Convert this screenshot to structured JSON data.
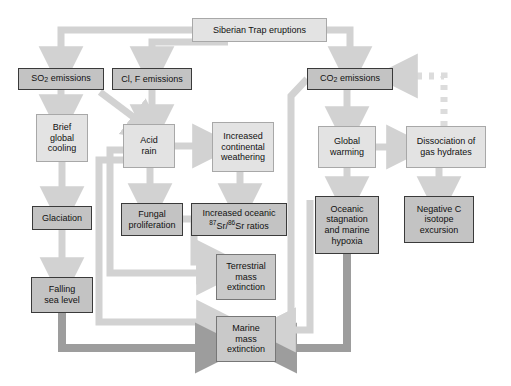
{
  "diagram": {
    "canvas": {
      "width": 511,
      "height": 386,
      "background": "#ffffff"
    },
    "colors": {
      "arrow_light": "#d2d2d2",
      "arrow_mid": "#bdbdbd",
      "arrow_dark": "#9d9d9d",
      "node_light_fill": "#e3e3e3",
      "node_light_border": "#a8a8a8",
      "node_mid_fill": "#c3c3c3",
      "node_mid_border": "#3a3a3a",
      "node_plain_fill": "#c9c9c9",
      "node_plain_border": "#777777",
      "text": "#111111"
    },
    "nodes": [
      {
        "id": "siberian",
        "label": "Siberian Trap eruptions",
        "style": "light",
        "x": 192,
        "y": 18,
        "w": 135,
        "h": 24
      },
      {
        "id": "so2",
        "label_html": "SO<span class=\"sub\">2</span> emissions",
        "label": "SO2 emissions",
        "style": "mid",
        "x": 18,
        "y": 68,
        "w": 86,
        "h": 22
      },
      {
        "id": "clf",
        "label": "Cl, F emissions",
        "style": "mid",
        "x": 112,
        "y": 68,
        "w": 80,
        "h": 22
      },
      {
        "id": "co2",
        "label_html": "CO<span class=\"sub\">2</span> emissions",
        "label": "CO2 emissions",
        "style": "mid",
        "x": 307,
        "y": 68,
        "w": 86,
        "h": 22
      },
      {
        "id": "brief",
        "label": "Brief\nglobal\ncooling",
        "style": "light",
        "x": 36,
        "y": 114,
        "w": 52,
        "h": 48
      },
      {
        "id": "acid",
        "label": "Acid\nrain",
        "style": "light",
        "x": 123,
        "y": 124,
        "w": 52,
        "h": 44
      },
      {
        "id": "weather",
        "label": "Increased\ncontinental\nweathering",
        "style": "light",
        "x": 212,
        "y": 122,
        "w": 62,
        "h": 50
      },
      {
        "id": "warming",
        "label": "Global\nwarming",
        "style": "light",
        "x": 318,
        "y": 126,
        "w": 58,
        "h": 42
      },
      {
        "id": "hydrates",
        "label": "Dissociation of\ngas hydrates",
        "style": "light",
        "x": 406,
        "y": 126,
        "w": 80,
        "h": 42
      },
      {
        "id": "glaciation",
        "label": "Glaciation",
        "style": "mid",
        "x": 32,
        "y": 206,
        "w": 60,
        "h": 24
      },
      {
        "id": "fungal",
        "label": "Fungal\nproliferation",
        "style": "mid",
        "x": 121,
        "y": 203,
        "w": 62,
        "h": 33
      },
      {
        "id": "srratio",
        "label_html": "Increased oceanic<br><span class=\"sup\">87</span>Sr/<span class=\"sup\">86</span>Sr ratios",
        "label": "Increased oceanic 87Sr/86Sr ratios",
        "style": "mid",
        "x": 191,
        "y": 203,
        "w": 96,
        "h": 33
      },
      {
        "id": "stagnation",
        "label": "Oceanic\nstagnation\nand marine\nhypoxia",
        "style": "mid",
        "x": 315,
        "y": 196,
        "w": 64,
        "h": 58
      },
      {
        "id": "negc",
        "label": "Negative C\nisotope\nexcursion",
        "style": "mid",
        "x": 404,
        "y": 196,
        "w": 70,
        "h": 47
      },
      {
        "id": "sealevel",
        "label": "Falling\nsea level",
        "style": "mid",
        "x": 31,
        "y": 277,
        "w": 62,
        "h": 36
      },
      {
        "id": "terrestrial",
        "label": "Terrestrial\nmass\nextinction",
        "style": "plain",
        "x": 216,
        "y": 254,
        "w": 60,
        "h": 46
      },
      {
        "id": "marine",
        "label": "Marine\nmass\nextinction",
        "style": "plain",
        "x": 216,
        "y": 316,
        "w": 60,
        "h": 46
      }
    ],
    "edges": [
      {
        "from": "siberian",
        "to": "so2",
        "kind": "solid",
        "tone": "light"
      },
      {
        "from": "siberian",
        "to": "clf",
        "kind": "solid",
        "tone": "light"
      },
      {
        "from": "siberian",
        "to": "co2",
        "kind": "solid",
        "tone": "light"
      },
      {
        "from": "so2",
        "to": "brief",
        "kind": "solid",
        "tone": "light"
      },
      {
        "from": "so2",
        "to": "acid",
        "kind": "solid",
        "tone": "light"
      },
      {
        "from": "clf",
        "to": "acid",
        "kind": "solid",
        "tone": "light"
      },
      {
        "from": "brief",
        "to": "glaciation",
        "kind": "solid",
        "tone": "light"
      },
      {
        "from": "glaciation",
        "to": "sealevel",
        "kind": "solid",
        "tone": "light"
      },
      {
        "from": "acid",
        "to": "fungal",
        "kind": "solid",
        "tone": "light"
      },
      {
        "from": "acid",
        "to": "weather",
        "kind": "solid",
        "tone": "light"
      },
      {
        "from": "co2",
        "to": "warming",
        "kind": "solid",
        "tone": "light"
      },
      {
        "from": "warming",
        "to": "hydrates",
        "kind": "solid",
        "tone": "light"
      },
      {
        "from": "warming",
        "to": "stagnation",
        "kind": "solid",
        "tone": "light"
      },
      {
        "from": "hydrates",
        "to": "negc",
        "kind": "solid",
        "tone": "light"
      },
      {
        "from": "hydrates",
        "to": "co2",
        "kind": "dotted",
        "tone": "light",
        "note": "positive feedback loop"
      },
      {
        "from": "weather",
        "to": "srratio",
        "kind": "solid",
        "tone": "light"
      },
      {
        "from": "acid",
        "to": "terrestrial",
        "kind": "solid",
        "tone": "light"
      },
      {
        "from": "fungal",
        "to": "terrestrial",
        "kind": "solid",
        "tone": "light"
      },
      {
        "from": "acid",
        "to": "marine",
        "kind": "solid",
        "tone": "light"
      },
      {
        "from": "sealevel",
        "to": "marine",
        "kind": "solid",
        "tone": "dark"
      },
      {
        "from": "co2",
        "to": "marine",
        "kind": "solid",
        "tone": "light"
      },
      {
        "from": "stagnation",
        "to": "marine",
        "kind": "solid",
        "tone": "dark"
      }
    ]
  }
}
